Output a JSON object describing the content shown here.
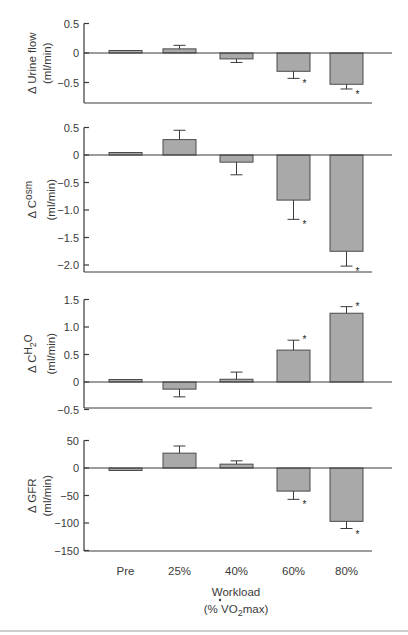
{
  "chart_data": [
    {
      "type": "bar",
      "id": "urine",
      "ylabel_main": "Δ Urine flow",
      "ylabel_unit": "(ml/min)",
      "categories": [
        "Pre",
        "25%",
        "40%",
        "60%",
        "80%"
      ],
      "values": [
        0.03,
        0.07,
        -0.1,
        -0.31,
        -0.53
      ],
      "errors": [
        0.0,
        0.06,
        -0.06,
        -0.12,
        -0.08
      ],
      "significant": [
        false,
        false,
        false,
        true,
        true
      ],
      "yticks": [
        0.5,
        0,
        -0.5
      ],
      "ytick_labels": [
        "0.5",
        "0",
        "−0.5"
      ],
      "ylim": [
        -0.85,
        0.5
      ]
    },
    {
      "type": "bar",
      "id": "cosm",
      "ylabel_main": "Δ C",
      "ylabel_sub": "osm",
      "ylabel_unit": "(ml/min)",
      "categories": [
        "Pre",
        "25%",
        "40%",
        "60%",
        "80%"
      ],
      "values": [
        0.03,
        0.28,
        -0.13,
        -0.82,
        -1.75
      ],
      "errors": [
        0.0,
        0.17,
        -0.23,
        -0.35,
        -0.27
      ],
      "significant": [
        false,
        false,
        false,
        true,
        true
      ],
      "yticks": [
        0.5,
        0,
        -0.5,
        -1.0,
        -1.5,
        -2.0
      ],
      "ytick_labels": [
        "0.5",
        "0",
        "−0.5",
        "−1.0",
        "−1.5",
        "−2.0"
      ],
      "ylim": [
        -2.12,
        0.5
      ]
    },
    {
      "type": "bar",
      "id": "ch2o",
      "ylabel_main": "Δ C",
      "ylabel_sub": "H2O",
      "ylabel_unit": "(ml/min)",
      "categories": [
        "Pre",
        "25%",
        "40%",
        "60%",
        "80%"
      ],
      "values": [
        0.02,
        -0.13,
        0.05,
        0.58,
        1.25
      ],
      "errors": [
        0.0,
        -0.14,
        0.13,
        0.18,
        0.12
      ],
      "significant": [
        false,
        false,
        false,
        true,
        true
      ],
      "yticks": [
        1.5,
        1.0,
        0.5,
        0,
        -0.5
      ],
      "ytick_labels": [
        "1.5",
        "1.0",
        "0.5",
        "0",
        "−0.5"
      ],
      "ylim": [
        -0.5,
        1.5
      ]
    },
    {
      "type": "bar",
      "id": "gfr",
      "ylabel_main": "Δ GFR",
      "ylabel_unit": "(ml/min)",
      "categories": [
        "Pre",
        "25%",
        "40%",
        "60%",
        "80%"
      ],
      "values": [
        -3,
        27,
        7,
        -42,
        -97
      ],
      "errors": [
        0,
        13,
        6,
        -15,
        -13
      ],
      "significant": [
        false,
        false,
        false,
        true,
        true
      ],
      "yticks": [
        50,
        0,
        -50,
        -100,
        -150
      ],
      "ytick_labels": [
        "50",
        "0",
        "−50",
        "−100",
        "−150"
      ],
      "ylim": [
        -150,
        50
      ]
    }
  ],
  "xaxis": {
    "tick_labels": [
      "Pre",
      "25%",
      "40%",
      "60%",
      "80%"
    ],
    "title_line1": "Workload",
    "title_line2_prefix": "(% ",
    "title_line2_v": "V",
    "title_line2_sub": "2",
    "title_line2_o": "O",
    "title_line2_suffix": "max)"
  },
  "significance_marker": "*",
  "colors": {
    "bar_fill": "#a9a9a9",
    "bar_stroke": "#4a4a4a",
    "axis": "#3a3a3a",
    "bottom_rule": "#bdbdbd"
  }
}
